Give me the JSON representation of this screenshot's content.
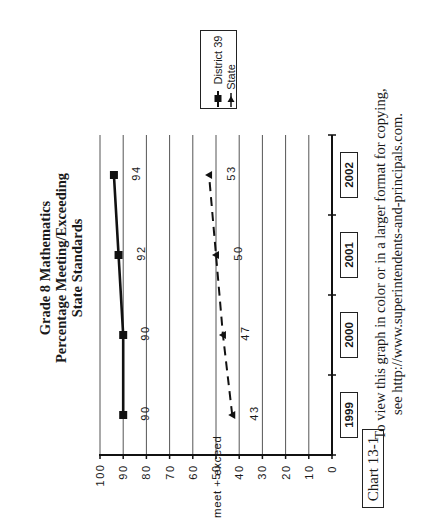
{
  "chart_data": {
    "type": "line",
    "orientation": "page rotated 90deg counter-clockwise",
    "title": "Grade 8 Mathematics Percentage Meeting/Exceeding State Standards",
    "title_lines": [
      "Grade 8 Mathematics",
      "Percentage Meeting/Exceeding",
      "State Standards"
    ],
    "categories": [
      "1999",
      "2000",
      "2001",
      "2002"
    ],
    "series": [
      {
        "name": "District 39",
        "values": [
          90,
          90,
          92,
          94
        ],
        "marker": "square",
        "line": "solid",
        "color": "#111111"
      },
      {
        "name": "State",
        "values": [
          43,
          47,
          50,
          53
        ],
        "marker": "triangle",
        "line": "dashed",
        "color": "#111111"
      }
    ],
    "xlabel": "",
    "ylabel": "% meet + exceed",
    "ylim": [
      0,
      100
    ],
    "yticks": [
      "0",
      "10",
      "20",
      "30",
      "40",
      "50",
      "60",
      "70",
      "80",
      "90",
      "100"
    ],
    "grid": true,
    "legend_position": "top-right of plot (rotated)",
    "data_labels": true
  },
  "labels": {
    "title_1": "Grade 8 Mathematics",
    "title_2": "Percentage Meeting/Exceeding",
    "title_3": "State Standards",
    "ylabel": "% meet + exceed",
    "legend_district": "District 39",
    "legend_state": "State",
    "footnote_1": "To view this graph in color or in a larger format for copying,",
    "footnote_2": "see http://www.superintendents-and-principals.com.",
    "chart_id": "Chart 13-1"
  }
}
